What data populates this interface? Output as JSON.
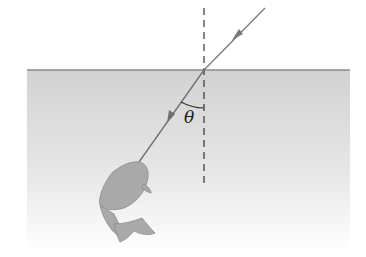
{
  "diagram": {
    "angle_label": "θ",
    "colors": {
      "water_top": "#d4d4d4",
      "water_bottom": "#ffffff",
      "surface_line": "#8a8a8a",
      "ray": "#7a7a7a",
      "normal": "#333333",
      "fish": "#a8a8a8"
    },
    "elements": [
      {
        "name": "incident-ray",
        "from": [
          265,
          8
        ],
        "to": [
          204,
          70
        ]
      },
      {
        "name": "refracted-ray",
        "from": [
          204,
          70
        ],
        "to": [
          139,
          160
        ]
      },
      {
        "name": "normal-line",
        "x": 204,
        "y_from": 8,
        "y_to": 186,
        "style": "dashed"
      },
      {
        "name": "water-surface",
        "y": 70,
        "x_from": 27,
        "x_to": 350
      },
      {
        "name": "angle-arc",
        "between": [
          "refracted-ray",
          "normal-line"
        ]
      },
      {
        "name": "fish",
        "position": [
          125,
          200
        ]
      }
    ]
  }
}
